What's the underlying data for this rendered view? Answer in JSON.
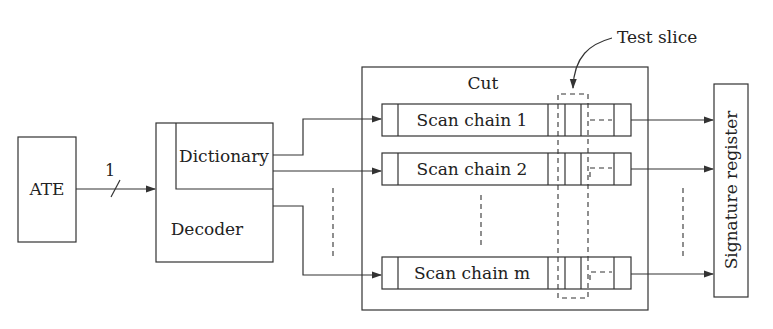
{
  "diagram": {
    "ate": {
      "label": "ATE"
    },
    "link": {
      "bus_width_label": "1"
    },
    "decoder": {
      "label": "Decoder",
      "dictionary_label": "Dictionary"
    },
    "cut": {
      "label": "Cut"
    },
    "scan_chains": [
      {
        "label": "Scan chain 1"
      },
      {
        "label": "Scan chain 2"
      },
      {
        "label": "Scan chain m"
      }
    ],
    "test_slice": {
      "label": "Test slice"
    },
    "signature_register": {
      "label": "Signature register"
    }
  }
}
